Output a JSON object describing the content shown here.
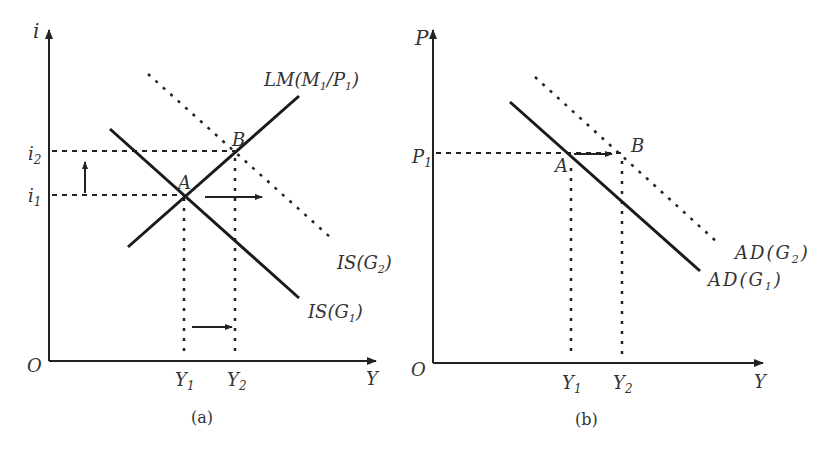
{
  "panel_a": {
    "caption": "(a)",
    "y_axis_label": "i",
    "x_axis_label": "Y",
    "origin_label": "O",
    "y_ticks": {
      "i2": "i",
      "i2_sub": "2",
      "i1": "i",
      "i1_sub": "1"
    },
    "x_ticks": {
      "y1": "Y",
      "y1_sub": "1",
      "y2": "Y",
      "y2_sub": "2"
    },
    "points": {
      "a": "A",
      "b": "B"
    },
    "curves": {
      "lm": {
        "pre": "LM(M",
        "sub1": "1",
        "mid": "/P",
        "sub2": "1",
        "post": ")"
      },
      "is_g1": {
        "pre": "IS(G",
        "sub": "1",
        "post": ")"
      },
      "is_g2": {
        "pre": "IS(G",
        "sub": "2",
        "post": ")"
      }
    }
  },
  "panel_b": {
    "caption": "(b)",
    "y_axis_label": "P",
    "x_axis_label": "Y",
    "origin_label": "O",
    "y_ticks": {
      "p1": "P",
      "p1_sub": "1"
    },
    "x_ticks": {
      "y1": "Y",
      "y1_sub": "1",
      "y2": "Y",
      "y2_sub": "2"
    },
    "points": {
      "a": "A",
      "b": "B"
    },
    "curves": {
      "ad_g1": {
        "pre": "AD(G",
        "sub": "1",
        "post": ")"
      },
      "ad_g2": {
        "pre": "AD(G",
        "sub": "2",
        "post": ")"
      }
    }
  }
}
